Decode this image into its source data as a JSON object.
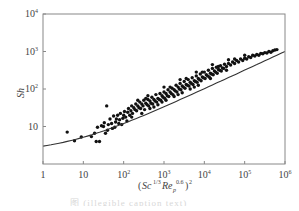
{
  "chart_data": {
    "type": "scatter",
    "title": "",
    "xlabel": "(Sc^{1/3} Re_p^{0.6})^2",
    "ylabel": "Sh",
    "xscale": "log",
    "yscale": "log",
    "xlim": [
      1,
      1000000
    ],
    "ylim": [
      1,
      10000
    ],
    "grid": false,
    "legend": null,
    "x_ticks": [
      "1",
      "10",
      "10^2",
      "10^3",
      "10^4",
      "10^5",
      "10^6"
    ],
    "y_ticks": [
      "10",
      "10^2",
      "10^3",
      "10^4"
    ],
    "series": [
      {
        "name": "experimental data",
        "kind": "scatter",
        "points_log10": [
          [
            0.6,
            0.85
          ],
          [
            0.78,
            0.62
          ],
          [
            0.95,
            0.72
          ],
          [
            1.2,
            0.73
          ],
          [
            1.28,
            0.82
          ],
          [
            1.32,
            0.6
          ],
          [
            1.4,
            0.6
          ],
          [
            1.35,
            0.98
          ],
          [
            1.45,
            1.02
          ],
          [
            1.5,
            1.0
          ],
          [
            1.52,
            1.1
          ],
          [
            1.55,
            0.82
          ],
          [
            1.58,
            1.55
          ],
          [
            1.6,
            0.9
          ],
          [
            1.62,
            1.05
          ],
          [
            1.66,
            1.2
          ],
          [
            1.7,
            1.08
          ],
          [
            1.72,
            0.95
          ],
          [
            1.75,
            1.28
          ],
          [
            1.78,
            0.98
          ],
          [
            1.8,
            1.12
          ],
          [
            1.82,
            1.2
          ],
          [
            1.85,
            1.3
          ],
          [
            1.88,
            1.08
          ],
          [
            1.9,
            1.18
          ],
          [
            1.92,
            1.35
          ],
          [
            1.95,
            1.05
          ],
          [
            1.98,
            1.22
          ],
          [
            2.0,
            1.3
          ],
          [
            2.02,
            1.4
          ],
          [
            2.05,
            1.25
          ],
          [
            2.08,
            1.15
          ],
          [
            2.1,
            1.38
          ],
          [
            2.12,
            1.48
          ],
          [
            2.15,
            1.3
          ],
          [
            2.18,
            1.42
          ],
          [
            2.2,
            1.55
          ],
          [
            2.22,
            1.35
          ],
          [
            2.25,
            1.5
          ],
          [
            2.28,
            1.45
          ],
          [
            2.3,
            1.6
          ],
          [
            2.32,
            1.42
          ],
          [
            2.35,
            1.55
          ],
          [
            2.38,
            1.5
          ],
          [
            2.4,
            1.65
          ],
          [
            2.42,
            1.48
          ],
          [
            2.45,
            1.6
          ],
          [
            2.48,
            1.55
          ],
          [
            2.5,
            1.7
          ],
          [
            2.52,
            1.45
          ],
          [
            2.55,
            1.62
          ],
          [
            2.58,
            1.58
          ],
          [
            2.6,
            1.72
          ],
          [
            2.62,
            1.55
          ],
          [
            2.65,
            1.68
          ],
          [
            2.68,
            1.62
          ],
          [
            2.7,
            1.78
          ],
          [
            2.72,
            1.6
          ],
          [
            2.75,
            1.72
          ],
          [
            2.78,
            1.68
          ],
          [
            2.8,
            1.85
          ],
          [
            2.82,
            1.65
          ],
          [
            2.85,
            1.75
          ],
          [
            2.88,
            1.72
          ],
          [
            2.9,
            1.88
          ],
          [
            2.92,
            1.7
          ],
          [
            2.95,
            1.82
          ],
          [
            2.98,
            1.78
          ],
          [
            3.0,
            1.92
          ],
          [
            3.02,
            1.75
          ],
          [
            3.05,
            1.88
          ],
          [
            3.08,
            1.82
          ],
          [
            3.1,
            1.98
          ],
          [
            3.12,
            1.8
          ],
          [
            3.15,
            1.92
          ],
          [
            3.18,
            1.88
          ],
          [
            3.2,
            2.02
          ],
          [
            3.22,
            1.85
          ],
          [
            3.25,
            1.98
          ],
          [
            3.28,
            1.95
          ],
          [
            3.3,
            2.1
          ],
          [
            3.32,
            1.92
          ],
          [
            3.35,
            2.05
          ],
          [
            3.38,
            2.0
          ],
          [
            3.4,
            2.15
          ],
          [
            3.42,
            1.98
          ],
          [
            3.45,
            2.08
          ],
          [
            3.48,
            2.05
          ],
          [
            3.5,
            2.2
          ],
          [
            3.52,
            2.02
          ],
          [
            3.55,
            2.12
          ],
          [
            3.58,
            2.1
          ],
          [
            3.6,
            2.25
          ],
          [
            3.62,
            2.08
          ],
          [
            3.65,
            2.18
          ],
          [
            3.68,
            2.15
          ],
          [
            3.7,
            2.3
          ],
          [
            3.72,
            2.12
          ],
          [
            3.75,
            2.22
          ],
          [
            3.78,
            2.2
          ],
          [
            3.8,
            2.35
          ],
          [
            3.82,
            2.18
          ],
          [
            3.85,
            2.28
          ],
          [
            3.88,
            2.25
          ],
          [
            3.9,
            2.4
          ],
          [
            3.92,
            2.22
          ],
          [
            3.95,
            2.32
          ],
          [
            3.98,
            2.3
          ],
          [
            4.0,
            2.45
          ],
          [
            4.02,
            2.28
          ],
          [
            4.05,
            2.38
          ],
          [
            4.08,
            2.35
          ],
          [
            4.1,
            2.5
          ],
          [
            4.12,
            2.32
          ],
          [
            4.15,
            2.42
          ],
          [
            4.18,
            2.4
          ],
          [
            4.2,
            2.55
          ],
          [
            4.22,
            2.38
          ],
          [
            4.25,
            2.48
          ],
          [
            4.28,
            2.45
          ],
          [
            4.3,
            2.58
          ],
          [
            4.32,
            2.42
          ],
          [
            4.35,
            2.52
          ],
          [
            4.38,
            2.5
          ],
          [
            4.4,
            2.62
          ],
          [
            4.42,
            2.48
          ],
          [
            4.45,
            2.56
          ],
          [
            4.48,
            2.55
          ],
          [
            4.5,
            2.66
          ],
          [
            4.55,
            2.6
          ],
          [
            4.6,
            2.68
          ],
          [
            4.65,
            2.64
          ],
          [
            4.7,
            2.72
          ],
          [
            4.75,
            2.68
          ],
          [
            4.8,
            2.76
          ],
          [
            4.85,
            2.72
          ],
          [
            4.9,
            2.8
          ],
          [
            4.95,
            2.76
          ],
          [
            5.0,
            2.82
          ],
          [
            5.05,
            2.8
          ],
          [
            5.1,
            2.86
          ],
          [
            5.15,
            2.84
          ],
          [
            5.2,
            2.9
          ],
          [
            5.25,
            2.88
          ],
          [
            5.3,
            2.92
          ],
          [
            5.35,
            2.9
          ],
          [
            5.4,
            2.95
          ],
          [
            5.45,
            2.94
          ],
          [
            5.5,
            2.97
          ],
          [
            5.55,
            2.96
          ],
          [
            5.6,
            3.0
          ],
          [
            5.65,
            2.98
          ],
          [
            5.7,
            3.02
          ],
          [
            5.75,
            3.04
          ],
          [
            5.8,
            3.05
          ],
          [
            2.35,
            1.7
          ],
          [
            2.55,
            1.75
          ],
          [
            2.75,
            1.52
          ],
          [
            2.95,
            1.65
          ],
          [
            3.15,
            2.05
          ],
          [
            3.35,
            1.85
          ],
          [
            3.55,
            2.28
          ],
          [
            3.75,
            2.05
          ],
          [
            3.95,
            2.45
          ],
          [
            4.15,
            2.28
          ],
          [
            4.35,
            2.6
          ],
          [
            4.55,
            2.5
          ],
          [
            4.75,
            2.8
          ],
          [
            2.45,
            1.35
          ],
          [
            2.65,
            1.48
          ],
          [
            2.85,
            1.58
          ],
          [
            3.05,
            1.7
          ],
          [
            3.25,
            1.8
          ],
          [
            3.45,
            1.9
          ],
          [
            3.65,
            2.0
          ],
          [
            3.85,
            2.1
          ],
          [
            2.2,
            1.25
          ],
          [
            2.6,
            1.82
          ],
          [
            3.0,
            2.05
          ],
          [
            3.4,
            2.25
          ],
          [
            3.8,
            2.45
          ],
          [
            4.2,
            2.65
          ],
          [
            4.6,
            2.78
          ],
          [
            5.0,
            2.9
          ]
        ]
      },
      {
        "name": "fitted curve",
        "kind": "line",
        "equation": "Sh = 2 + X^0.5",
        "x_log10": [
          0,
          0.5,
          1,
          1.5,
          2,
          2.5,
          3,
          3.5,
          4,
          4.5,
          5,
          5.5,
          6
        ],
        "y": [
          3,
          3.78,
          5.16,
          7.62,
          12,
          19.78,
          33.62,
          58.23,
          102,
          179.8,
          318.2,
          564.3,
          1002
        ]
      }
    ]
  },
  "caption": "图 (illegible caption text)"
}
